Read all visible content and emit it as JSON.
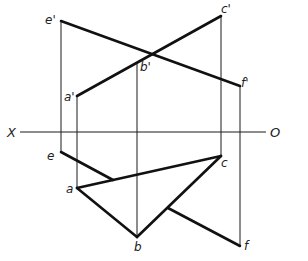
{
  "diagram": {
    "type": "orthographic-projection",
    "axis": {
      "left_label": "X",
      "right_label": "O"
    },
    "front_view": {
      "points": {
        "e_prime": {
          "label": "e'"
        },
        "c_prime": {
          "label": "c'"
        },
        "b_prime": {
          "label": "b'"
        },
        "a_prime": {
          "label": "a'"
        },
        "f_prime": {
          "label": "f'"
        }
      },
      "segments": [
        "a'c'",
        "e'f'"
      ]
    },
    "top_view": {
      "points": {
        "e": {
          "label": "e"
        },
        "a": {
          "label": "a"
        },
        "b": {
          "label": "b"
        },
        "c": {
          "label": "c"
        },
        "f": {
          "label": "f"
        }
      },
      "segments": [
        "ab",
        "bc",
        "ca",
        "ef"
      ]
    }
  }
}
